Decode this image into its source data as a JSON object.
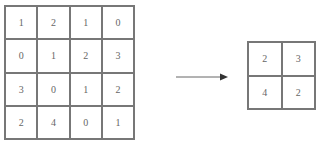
{
  "input_matrix": {
    "rows": [
      [
        "1",
        "2",
        "1",
        "0"
      ],
      [
        "0",
        "1",
        "2",
        "3"
      ],
      [
        "3",
        "0",
        "1",
        "2"
      ],
      [
        "2",
        "4",
        "0",
        "1"
      ]
    ]
  },
  "arrow": {
    "direction": "right"
  },
  "output_matrix": {
    "rows": [
      [
        "2",
        "3"
      ],
      [
        "4",
        "2"
      ]
    ]
  }
}
